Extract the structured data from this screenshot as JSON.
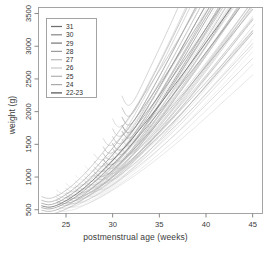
{
  "chart_data": {
    "type": "line",
    "title": "",
    "subtitle": "",
    "xlabel": "postmenstrual age (weeks)",
    "ylabel": "weight (g)",
    "xlim": [
      22,
      46
    ],
    "ylim": [
      450,
      3600
    ],
    "xticks": [
      25,
      30,
      35,
      40,
      45
    ],
    "xticklabels": [
      "25",
      "30",
      "35",
      "40",
      "45"
    ],
    "yticks": [
      500,
      1000,
      1500,
      2000,
      2500,
      3000,
      3500
    ],
    "yticklabels": [
      "500",
      "1000",
      "1500",
      "2000",
      "2500",
      "3000",
      "3500"
    ],
    "grid": false,
    "legend_position": "top-left",
    "legend_title": "",
    "legend": [
      {
        "label": "31",
        "color": "#6e6e6e"
      },
      {
        "label": "30",
        "color": "#8a8a8a"
      },
      {
        "label": "29",
        "color": "#7a7a7a"
      },
      {
        "label": "28",
        "color": "#9c9c9c"
      },
      {
        "label": "27",
        "color": "#bcbcbc"
      },
      {
        "label": "26",
        "color": "#c9c9c9"
      },
      {
        "label": "25",
        "color": "#b2b2b2"
      },
      {
        "label": "24",
        "color": "#aaaaaa"
      },
      {
        "label": "22-23",
        "color": "#555555"
      }
    ],
    "series": [
      {
        "name": "31",
        "color": "#6e6e6e",
        "x": [
          31.0,
          31.4,
          31.8,
          32.4,
          33.2,
          34.2,
          35.4,
          36.8,
          38.4,
          40.2,
          42.0,
          44.0,
          46.0
        ],
        "y": [
          1790,
          1700,
          1680,
          1760,
          1940,
          2180,
          2470,
          2820,
          3230,
          3680,
          4130,
          4620,
          5120
        ]
      },
      {
        "name": "30",
        "color": "#8a8a8a",
        "x": [
          30.0,
          30.4,
          30.9,
          31.6,
          32.5,
          33.6,
          34.9,
          36.4,
          38.1,
          40.0,
          42.0,
          44.0,
          46.0
        ],
        "y": [
          1510,
          1430,
          1415,
          1490,
          1660,
          1890,
          2180,
          2530,
          2940,
          3400,
          3880,
          4380,
          4890
        ]
      },
      {
        "name": "29",
        "color": "#7a7a7a",
        "x": [
          29.0,
          29.4,
          29.9,
          30.6,
          31.5,
          32.6,
          33.9,
          35.4,
          37.1,
          39.0,
          41.0,
          43.0,
          45.0
        ],
        "y": [
          1270,
          1200,
          1190,
          1255,
          1400,
          1610,
          1880,
          2210,
          2600,
          3040,
          3510,
          4000,
          4500
        ]
      },
      {
        "name": "28",
        "color": "#9c9c9c",
        "x": [
          28.0,
          28.5,
          29.0,
          29.8,
          30.8,
          32.0,
          33.4,
          35.0,
          36.8,
          38.8,
          40.9,
          43.0,
          45.2
        ],
        "y": [
          1080,
          1020,
          1015,
          1075,
          1205,
          1400,
          1650,
          1960,
          2330,
          2750,
          3200,
          3680,
          4170
        ]
      },
      {
        "name": "27",
        "color": "#bcbcbc",
        "x": [
          27.0,
          27.5,
          28.0,
          28.8,
          29.8,
          31.0,
          32.5,
          34.2,
          36.1,
          38.2,
          40.4,
          42.7,
          45.0
        ],
        "y": [
          940,
          885,
          880,
          930,
          1045,
          1220,
          1455,
          1745,
          2090,
          2490,
          2930,
          3400,
          3890
        ]
      },
      {
        "name": "26",
        "color": "#c9c9c9",
        "x": [
          26.0,
          26.5,
          27.0,
          27.8,
          28.9,
          30.2,
          31.8,
          33.6,
          35.6,
          37.8,
          40.1,
          42.5,
          45.0
        ],
        "y": [
          820,
          775,
          770,
          815,
          915,
          1070,
          1285,
          1555,
          1880,
          2260,
          2690,
          3150,
          3640
        ]
      },
      {
        "name": "25",
        "color": "#b2b2b2",
        "x": [
          25.0,
          25.5,
          26.0,
          26.9,
          28.0,
          29.4,
          31.0,
          32.9,
          35.0,
          37.3,
          39.7,
          42.3,
          45.0
        ],
        "y": [
          720,
          680,
          675,
          715,
          805,
          945,
          1140,
          1390,
          1695,
          2055,
          2470,
          2920,
          3400
        ]
      },
      {
        "name": "24",
        "color": "#aaaaaa",
        "x": [
          24.0,
          24.5,
          25.0,
          25.9,
          27.0,
          28.5,
          30.2,
          32.2,
          34.4,
          36.8,
          39.4,
          42.1,
          45.0
        ],
        "y": [
          640,
          600,
          598,
          632,
          712,
          840,
          1020,
          1255,
          1545,
          1890,
          2290,
          2730,
          3200
        ]
      },
      {
        "name": "22-23",
        "color": "#555555",
        "x": [
          22.4,
          23.0,
          23.6,
          24.5,
          25.8,
          27.4,
          29.3,
          31.5,
          34.0,
          36.6,
          39.4,
          42.2,
          45.0
        ],
        "y": [
          560,
          540,
          548,
          600,
          710,
          890,
          1150,
          1490,
          1920,
          2400,
          2940,
          3490,
          4050
        ]
      }
    ]
  }
}
